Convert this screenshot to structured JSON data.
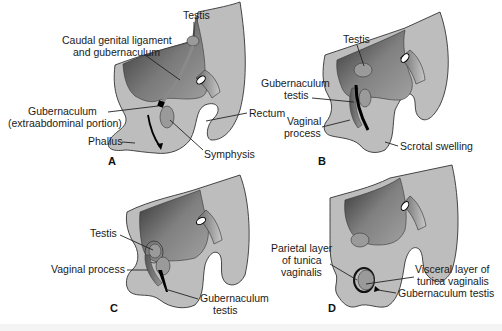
{
  "figure": {
    "panels": [
      {
        "id": "A",
        "labels": {
          "testis": "Testis",
          "caudal_line1": "Caudal genital ligament",
          "caudal_line2": "and gubernaculum",
          "gub_line1": "Gubernaculum",
          "gub_line2": "(extraabdominal portion)",
          "rectum": "Rectum",
          "phallus": "Phallus",
          "symphysis": "Symphysis"
        }
      },
      {
        "id": "B",
        "labels": {
          "testis": "Testis",
          "gub_line1": "Gubernaculum",
          "gub_line2": "testis",
          "vag_line1": "Vaginal",
          "vag_line2": "process",
          "scrotal": "Scrotal swelling"
        }
      },
      {
        "id": "C",
        "labels": {
          "testis": "Testis",
          "vaginal_process": "Vaginal process",
          "gub_line1": "Gubernaculum",
          "gub_line2": "testis"
        }
      },
      {
        "id": "D",
        "labels": {
          "parietal_line1": "Parietal layer",
          "parietal_line2": "of tunica",
          "parietal_line3": "vaginalis",
          "visceral_line1": "Visceral layer of",
          "visceral_line2": "tunica vaginalis",
          "gubernaculum": "Gubernaculum testis"
        }
      }
    ],
    "colors": {
      "tissue": "#bdbdbd",
      "cavity_dark": "#3a3a3a",
      "cavity_light": "#8f8f8f",
      "organ": "#9a9a9a",
      "line": "#222222"
    }
  }
}
